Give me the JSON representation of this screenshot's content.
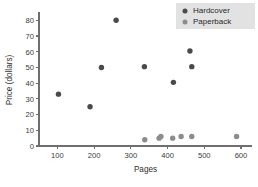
{
  "chart_data": {
    "type": "scatter",
    "title": "",
    "xlabel": "Pages",
    "ylabel": "Price (dollars)",
    "xlim": [
      50,
      630
    ],
    "ylim": [
      0,
      84
    ],
    "xticks": [
      100,
      200,
      300,
      400,
      500,
      600
    ],
    "yticks": [
      0,
      10,
      20,
      30,
      40,
      50,
      60,
      70,
      80
    ],
    "grid": false,
    "legend_position": "top-right",
    "series": [
      {
        "name": "Hardcover",
        "color": "#4a4a4a",
        "marker": "circle",
        "points": [
          {
            "x": 103,
            "y": 33
          },
          {
            "x": 189,
            "y": 25
          },
          {
            "x": 220,
            "y": 50
          },
          {
            "x": 260,
            "y": 80
          },
          {
            "x": 337,
            "y": 50.5
          },
          {
            "x": 416,
            "y": 40.5
          },
          {
            "x": 461,
            "y": 60.5
          },
          {
            "x": 466,
            "y": 50.5
          }
        ]
      },
      {
        "name": "Paperback",
        "color": "#8c8c8c",
        "marker": "circle",
        "points": [
          {
            "x": 338,
            "y": 4
          },
          {
            "x": 377,
            "y": 5
          },
          {
            "x": 382,
            "y": 6
          },
          {
            "x": 414,
            "y": 5
          },
          {
            "x": 437,
            "y": 6
          },
          {
            "x": 466,
            "y": 6
          },
          {
            "x": 588,
            "y": 6
          }
        ]
      }
    ]
  },
  "legend": {
    "entries": [
      {
        "label": "Hardcover",
        "color": "#4a4a4a"
      },
      {
        "label": "Paperback",
        "color": "#8c8c8c"
      }
    ],
    "background": "#e2e2e2"
  },
  "axes": {
    "x_title": "Pages",
    "y_title": "Price (dollars)",
    "x_tick_labels": [
      "100",
      "200",
      "300",
      "400",
      "500",
      "600"
    ],
    "y_tick_labels": [
      "0",
      "10",
      "20",
      "30",
      "40",
      "50",
      "60",
      "70",
      "80"
    ],
    "axis_color": "#6e6e6e"
  }
}
